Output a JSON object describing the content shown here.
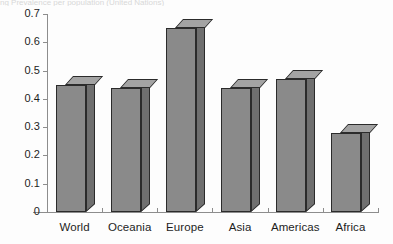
{
  "figure": {
    "caption_remnant": "ng  Prevalence per population (United Nations)",
    "background_color": "#fdfdfd"
  },
  "chart_data": {
    "type": "bar",
    "title": "",
    "subtitle": "",
    "xlabel": "",
    "ylabel": "",
    "categories": [
      "World",
      "Oceania",
      "Europe",
      "Asia",
      "Americas",
      "Africa"
    ],
    "values": [
      0.45,
      0.44,
      0.65,
      0.44,
      0.47,
      0.28
    ],
    "series": [
      {
        "name": "",
        "values": [
          0.45,
          0.44,
          0.65,
          0.44,
          0.47,
          0.28
        ]
      }
    ],
    "ylim": [
      0,
      0.7
    ],
    "ytick_labels": [
      "0.7",
      "0.6",
      "0.5",
      "0.4",
      "0.3",
      "0.2",
      "0.1",
      "0"
    ],
    "ytick_values": [
      0.7,
      0.6,
      0.5,
      0.4,
      0.3,
      0.2,
      0.1,
      0
    ],
    "ytick_step": 0.1,
    "grid": false,
    "legend": false,
    "legend_position": "none",
    "style": "3d-column",
    "annotations": [],
    "colors": {
      "bar_front": "#8a8a8a",
      "bar_top": "#a3a3a3",
      "bar_side": "#6f6f6f",
      "bar_outline": "#2b2b2b",
      "axis": "#8d8d8d",
      "text": "#1d1d1d"
    }
  }
}
